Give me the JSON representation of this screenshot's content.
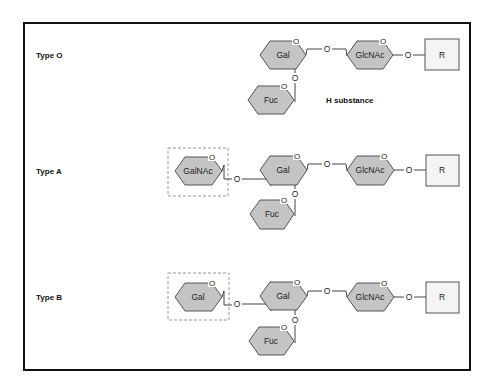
{
  "diagram": {
    "colors": {
      "sugar_fill": "#c4c4c4",
      "sugar_stroke": "#555555",
      "frame": "#111111",
      "dashed_box": "#999999"
    },
    "rows": [
      {
        "label": "Type O",
        "terminal_sugar": null,
        "chain": [
          "Gal",
          "GlcNAc",
          "R"
        ],
        "branch": "Fuc",
        "caption": "H substance"
      },
      {
        "label": "Type A",
        "terminal_sugar": "GalNAc",
        "chain": [
          "Gal",
          "GlcNAc",
          "R"
        ],
        "branch": "Fuc",
        "caption": null
      },
      {
        "label": "Type B",
        "terminal_sugar": "Gal",
        "chain": [
          "Gal",
          "GlcNAc",
          "R"
        ],
        "branch": "Fuc",
        "caption": null
      }
    ],
    "ring_oxygen": "O",
    "link_oxygen": "O"
  }
}
